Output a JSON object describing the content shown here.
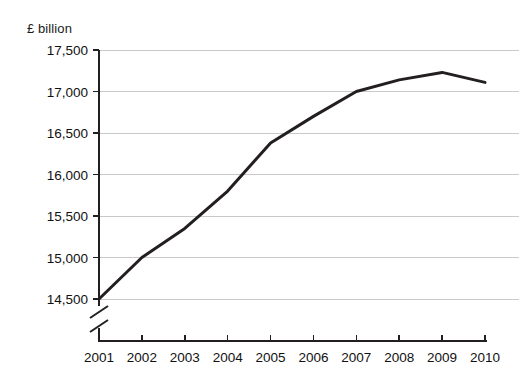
{
  "chart_data": {
    "type": "line",
    "title": "",
    "subtitle": "",
    "ylabel": "£ billion",
    "xlabel": "",
    "x": [
      2001,
      2002,
      2003,
      2004,
      2005,
      2006,
      2007,
      2008,
      2009,
      2010
    ],
    "xtick_labels": [
      "2001",
      "2002",
      "2003",
      "2004",
      "2005",
      "2006",
      "2007",
      "2008",
      "2009",
      "2010"
    ],
    "ytick_labels": [
      "17,500",
      "17,000",
      "16,500",
      "16,000",
      "15,500",
      "15,000",
      "14,500"
    ],
    "ytick_values": [
      17500,
      17000,
      16500,
      16000,
      15500,
      15000,
      14500
    ],
    "ylim": [
      14500,
      17500
    ],
    "xlim": [
      2001,
      2010
    ],
    "axis_break": true,
    "axis_break_note": "y-axis broken below 14,500",
    "grid": "horizontal",
    "legend": "none",
    "series": [
      {
        "name": "£ billion",
        "color": "#231f20",
        "values": [
          14500,
          15000,
          15350,
          15800,
          16380,
          16700,
          17000,
          17140,
          17230,
          17110
        ]
      }
    ],
    "colors": {
      "line": "#231f20",
      "grid": "#c9c9c9",
      "axis": "#231f20",
      "text": "#111111",
      "background": "#ffffff"
    }
  }
}
